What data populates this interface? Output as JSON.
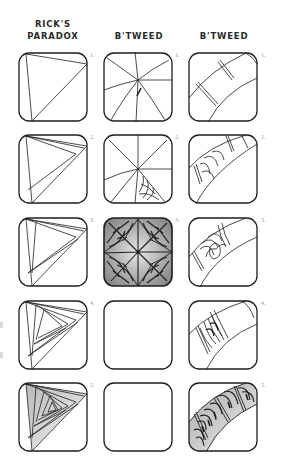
{
  "columns": [
    {
      "title_line1": "RICK'S",
      "title_line2": "PARADOX"
    },
    {
      "title_line1": "",
      "title_line2": "B'TWEED"
    },
    {
      "title_line1": "",
      "title_line2": "B'TWEED"
    }
  ],
  "steps": [
    "1.",
    "2.",
    "3.",
    "4.",
    "5."
  ],
  "grid": {
    "col_x": [
      18,
      103,
      188
    ],
    "row_y": [
      52,
      134,
      217,
      300,
      382
    ],
    "tile_size": 70
  },
  "colors": {
    "ink": "#1e1e1e",
    "label": "#9a9a9a",
    "background": "#ffffff"
  }
}
